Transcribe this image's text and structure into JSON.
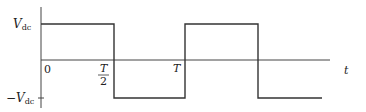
{
  "figure": {
    "type": "square-wave",
    "labels": {
      "vdc": "V",
      "vdc_sub": "dc",
      "neg_vdc": "−V",
      "neg_vdc_sub": "dc",
      "origin": "0",
      "half_period_num": "T",
      "half_period_den": "2",
      "period": "T",
      "time_axis": "t"
    },
    "colors": {
      "line": "#333333",
      "background": "#ffffff"
    }
  }
}
